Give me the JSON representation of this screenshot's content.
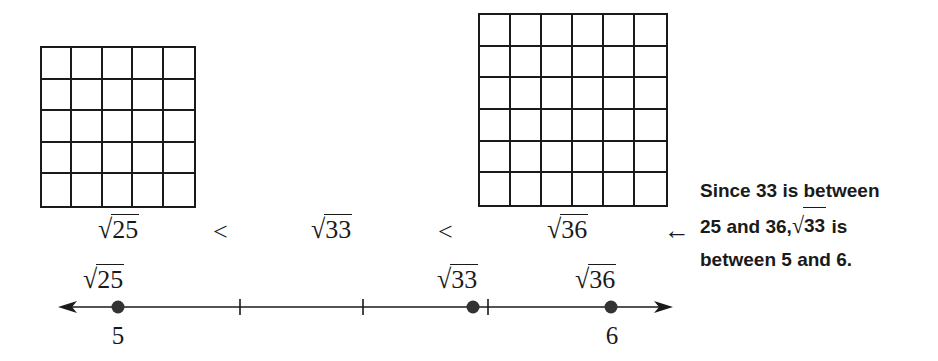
{
  "grids": [
    {
      "name": "square-25",
      "rows": 5,
      "cols": 5,
      "label_radicand": "25"
    },
    {
      "name": "square-36",
      "rows": 6,
      "cols": 6,
      "label_radicand": "36"
    }
  ],
  "inequality": {
    "left": "25",
    "op1": "<",
    "middle": "33",
    "op2": "<",
    "right": "36",
    "arrow": "←"
  },
  "explanation": {
    "line1": "Since 33 is between",
    "line2_prefix": "25 and 36,",
    "line2_radicand": "33",
    "line2_suffix": " is",
    "line3": "between 5 and 6."
  },
  "number_line": {
    "points": [
      {
        "radicand": "25",
        "value_label": "5"
      },
      {
        "radicand": "33",
        "value_label": ""
      },
      {
        "radicand": "36",
        "value_label": "6"
      }
    ],
    "tick_count_between": 3
  },
  "chart_data": {
    "type": "number_line",
    "range": [
      5,
      6
    ],
    "points": [
      {
        "label": "√25",
        "value": 5
      },
      {
        "label": "√33",
        "value": 5.745
      },
      {
        "label": "√36",
        "value": 6
      }
    ],
    "ticks": [
      5,
      5.25,
      5.5,
      5.75,
      6
    ],
    "tick_labels": {
      "5": "5",
      "6": "6"
    },
    "annotation": "Since 33 is between 25 and 36, √33 is between 5 and 6."
  }
}
